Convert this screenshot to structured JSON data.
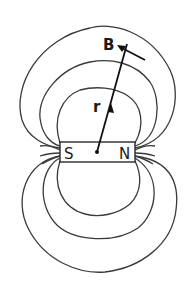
{
  "diagram": {
    "title": "",
    "labels": {
      "field": "B",
      "position": "r",
      "south_pole": "S",
      "north_pole": "N"
    },
    "colors": {
      "lines": "#3a3a3a",
      "text": "#1a1a1a",
      "background": "#ffffff"
    },
    "elements": {
      "magnet": "bar magnet with poles S (left) and N (right), dot at center",
      "field_lines": "3 closed field loops above and 3 below the magnet, plus short stub lines at each pole",
      "vectors": [
        "r: position vector from magnet center",
        "B: field vector tangent to outer loop"
      ]
    }
  }
}
